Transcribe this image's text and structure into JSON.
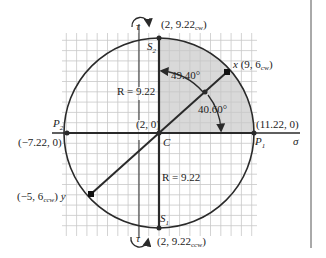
{
  "diagram": {
    "type": "mohr-circle",
    "center": {
      "label": "C",
      "coords": "(2, 0)"
    },
    "radius_label": "R = 9.22",
    "axis_label": "σ",
    "shear_label": "τ",
    "points": {
      "S2": {
        "name": "S",
        "sub": "2",
        "coords": "(2, 9.22",
        "coords_sub": "cw",
        "coords_end": ")"
      },
      "S1": {
        "name": "S",
        "sub": "1",
        "coords": "(2, 9.22",
        "coords_sub": "ccw",
        "coords_end": ")"
      },
      "P1": {
        "name": "P",
        "sub": "1",
        "coords": "(11.22, 0)"
      },
      "P2": {
        "name": "P",
        "sub": "2",
        "coords": "(−7.22, 0)"
      },
      "x": {
        "name": "x",
        "coords": "(9, 6",
        "coords_sub": "cw",
        "coords_end": ")"
      },
      "y": {
        "name": "y",
        "coords": "(−5, 6",
        "coords_sub": "ccw",
        "coords_end": ")"
      }
    },
    "angles": {
      "a1": "49.40°",
      "a2": "40.60°"
    },
    "colors": {
      "line": "#2a2a2a",
      "grid": "#c8c8c8",
      "shade": "#d9d9d9"
    }
  }
}
